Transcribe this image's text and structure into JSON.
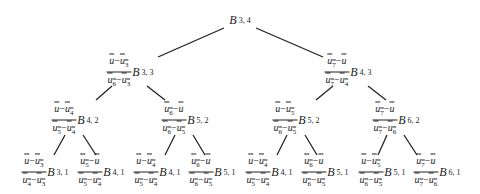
{
  "diagram": {
    "root": {
      "label": "B",
      "sub": "3, 4"
    },
    "level1": [
      {
        "num": "ū−ū₃",
        "num_parts": [
          "ū",
          "−",
          "ū",
          "3"
        ],
        "den_parts": [
          "ū",
          "6",
          "−",
          "ū",
          "3"
        ],
        "label": "B",
        "sub": "3, 3"
      },
      {
        "num_parts": [
          "ū",
          "7",
          "−",
          "ū",
          ""
        ],
        "den_parts": [
          "ū",
          "7",
          "−",
          "ū",
          "4"
        ],
        "label": "B",
        "sub": "4, 3"
      }
    ],
    "level2": [
      {
        "num_parts": [
          "ū",
          "",
          "−",
          "ū",
          "4"
        ],
        "den_parts": [
          "ū",
          "5",
          "−",
          "ū",
          "4"
        ],
        "label": "B",
        "sub": "4, 2"
      },
      {
        "num_parts": [
          "ū",
          "6",
          "−",
          "ū",
          ""
        ],
        "den_parts": [
          "ū",
          "6",
          "−",
          "ū",
          "5"
        ],
        "label": "B",
        "sub": "5, 2"
      },
      {
        "num_parts": [
          "ū",
          "",
          "−",
          "ū",
          "5"
        ],
        "den_parts": [
          "ū",
          "6",
          "−",
          "ū",
          "5"
        ],
        "label": "B",
        "sub": "5, 2"
      },
      {
        "num_parts": [
          "ū",
          "7",
          "−",
          "ū",
          ""
        ],
        "den_parts": [
          "ū",
          "7",
          "−",
          "ū",
          "6"
        ],
        "label": "B",
        "sub": "6, 2"
      }
    ],
    "level3": [
      {
        "num_parts": [
          "ū",
          "",
          "−",
          "ū",
          "3"
        ],
        "den_parts": [
          "ū",
          "4",
          "−",
          "ū",
          "3"
        ],
        "label": "B",
        "sub": "3, 1"
      },
      {
        "num_parts": [
          "ū",
          "5",
          "−",
          "ū",
          ""
        ],
        "den_parts": [
          "ū",
          "5",
          "−",
          "ū",
          "4"
        ],
        "label": "B",
        "sub": "4, 1"
      },
      {
        "num_parts": [
          "ū",
          "",
          "−",
          "ū",
          "4"
        ],
        "den_parts": [
          "ū",
          "5",
          "−",
          "ū",
          "4"
        ],
        "label": "B",
        "sub": "4, 1"
      },
      {
        "num_parts": [
          "ū",
          "6",
          "−",
          "ū",
          ""
        ],
        "den_parts": [
          "ū",
          "6",
          "−",
          "ū",
          "5"
        ],
        "label": "B",
        "sub": "5, 1"
      },
      {
        "num_parts": [
          "ū",
          "",
          "−",
          "ū",
          "4"
        ],
        "den_parts": [
          "ū",
          "5",
          "−",
          "ū",
          "4"
        ],
        "label": "B",
        "sub": "4, 1"
      },
      {
        "num_parts": [
          "ū",
          "6",
          "−",
          "ū",
          ""
        ],
        "den_parts": [
          "ū",
          "6",
          "−",
          "ū",
          "5"
        ],
        "label": "B",
        "sub": "5, 1"
      },
      {
        "num_parts": [
          "ū",
          "",
          "−",
          "ū",
          "5"
        ],
        "den_parts": [
          "ū",
          "6",
          "−",
          "ū",
          "5"
        ],
        "label": "B",
        "sub": "5, 1"
      },
      {
        "num_parts": [
          "ū",
          "7",
          "−",
          "ū",
          ""
        ],
        "den_parts": [
          "ū",
          "7",
          "−",
          "ū",
          "6"
        ],
        "label": "B",
        "sub": "6, 1"
      }
    ],
    "edge_color": "#222222"
  }
}
